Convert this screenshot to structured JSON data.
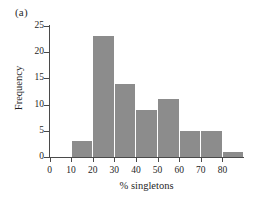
{
  "figure": {
    "panel_label": "(a)",
    "bar_color": "#8c8c8c",
    "axis_color": "#4a4a4a",
    "background": "#ffffff"
  },
  "chart_data": {
    "type": "bar",
    "title": "",
    "subtitle": "",
    "xlabel": "% singletons",
    "ylabel": "Frequency",
    "grid": false,
    "legend": null,
    "xlim": [
      0,
      90
    ],
    "ylim": [
      0,
      25
    ],
    "xticks": [
      0,
      10,
      20,
      30,
      40,
      50,
      60,
      70,
      80
    ],
    "xtick_labels": [
      "0",
      "10",
      "20",
      "30",
      "40",
      "50",
      "60",
      "70",
      "80"
    ],
    "yticks": [
      0,
      5,
      10,
      15,
      20,
      25
    ],
    "ytick_labels": [
      "0",
      "5",
      "10",
      "15",
      "20",
      "25"
    ],
    "bin_width": 10,
    "categories": [
      "0-10",
      "10-20",
      "20-30",
      "30-40",
      "40-50",
      "50-60",
      "60-70",
      "70-80",
      "80-90"
    ],
    "bin_starts": [
      0,
      10,
      20,
      30,
      40,
      50,
      60,
      70,
      80
    ],
    "values": [
      0,
      3,
      23,
      14,
      9,
      11,
      5,
      5,
      1
    ],
    "annotations": [
      "(a)"
    ]
  }
}
